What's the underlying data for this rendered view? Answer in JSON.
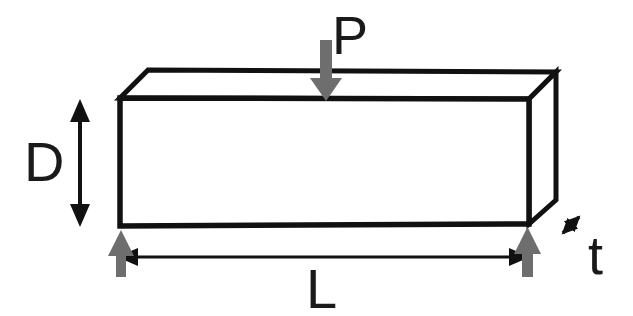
{
  "diagram": {
    "type": "engineering-schematic",
    "background_color": "#ffffff",
    "outline_color": "#111111",
    "arrow_gray_color": "#6e6e6e",
    "labels": {
      "load": "P",
      "depth": "D",
      "length": "L",
      "thickness": "t"
    },
    "geometry": {
      "front_face": {
        "top_left": [
          120,
          98
        ],
        "top_right": [
          529,
          99
        ],
        "bottom_right": [
          529,
          224
        ],
        "bottom_left": [
          120,
          226
        ]
      },
      "back_top_edge": {
        "left": [
          148,
          70
        ],
        "right": [
          556,
          72
        ]
      },
      "right_face": {
        "back_top": [
          556,
          72
        ],
        "back_bottom": [
          556,
          200
        ]
      }
    },
    "annotations": {
      "load_arrow": {
        "name": "P",
        "direction": "down",
        "color": "#6e6e6e",
        "from": [
          326,
          40
        ],
        "to": [
          326,
          99
        ]
      },
      "depth_arrow": {
        "name": "D",
        "direction": "double-vertical",
        "color": "#111111",
        "from": [
          80,
          100
        ],
        "to": [
          80,
          226
        ]
      },
      "length_arrow": {
        "name": "L",
        "direction": "double-horizontal",
        "color": "#111111",
        "from": [
          120,
          257
        ],
        "to": [
          527,
          257
        ]
      },
      "thickness_arrow": {
        "name": "t",
        "direction": "double-diagonal",
        "color": "#111111",
        "from": [
          557,
          239
        ],
        "to": [
          585,
          211
        ]
      },
      "support_left": {
        "direction": "up",
        "color": "#6e6e6e",
        "from": [
          120,
          277
        ],
        "to": [
          120,
          230
        ]
      },
      "support_right": {
        "direction": "up",
        "color": "#6e6e6e",
        "from": [
          527,
          277
        ],
        "to": [
          527,
          228
        ]
      }
    }
  }
}
